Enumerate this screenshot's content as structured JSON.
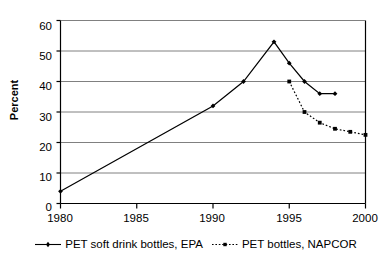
{
  "chart_data": {
    "type": "line",
    "title": "",
    "xlabel": "",
    "ylabel": "Percent",
    "xlim": [
      1980,
      2000
    ],
    "ylim": [
      0,
      60
    ],
    "grid": true,
    "legend_position": "bottom",
    "yticks": [
      0,
      10,
      20,
      30,
      40,
      50,
      60
    ],
    "ytick_labels": [
      "0",
      "10",
      "20",
      "30",
      "40",
      "50",
      "60"
    ],
    "xticks": [
      1980,
      1985,
      1990,
      1995,
      2000
    ],
    "xtick_labels": [
      "1980",
      "1985",
      "1990",
      "1995",
      "2000"
    ],
    "series": [
      {
        "name": "PET soft drink bottles, EPA",
        "style": "solid",
        "marker": "diamond",
        "color": "#000000",
        "x": [
          1980,
          1990,
          1992,
          1994,
          1995,
          1996,
          1997,
          1998
        ],
        "values": [
          4,
          32,
          40,
          53,
          46,
          40,
          36,
          36
        ]
      },
      {
        "name": "PET bottles, NAPCOR",
        "style": "dotted",
        "marker": "square",
        "color": "#000000",
        "x": [
          1995,
          1996,
          1997,
          1998,
          1999,
          2000
        ],
        "values": [
          40,
          30,
          26.5,
          24.5,
          23.5,
          22.5
        ]
      }
    ]
  },
  "legend": {
    "entries": [
      {
        "label": "PET soft drink bottles, EPA"
      },
      {
        "label": "PET bottles, NAPCOR"
      }
    ]
  },
  "colors": {
    "axis": "#000000",
    "grid": "#808080",
    "series1": "#000000",
    "series2": "#000000",
    "background": "#ffffff"
  }
}
